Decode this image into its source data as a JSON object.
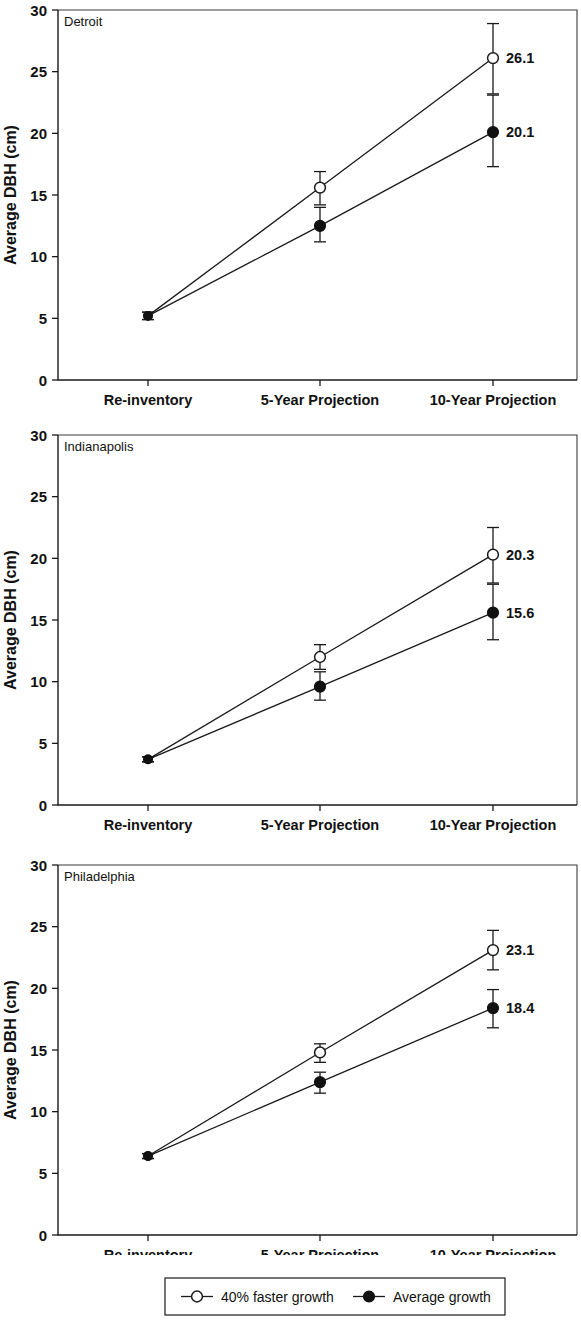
{
  "figure": {
    "y_axis_title": "Average DBH (cm)",
    "y_ticks": [
      "0",
      "5",
      "10",
      "15",
      "20",
      "25",
      "30"
    ],
    "x_categories": [
      "Re-inventory",
      "5-Year Projection",
      "10-Year Projection"
    ]
  },
  "legend": {
    "items": [
      {
        "label": "40% faster growth",
        "marker": "open-circle"
      },
      {
        "label": "Average growth",
        "marker": "filled-circle"
      }
    ]
  },
  "panels": [
    {
      "id": "detroit",
      "label": "Detroit"
    },
    {
      "id": "indianapolis",
      "label": "Indianapolis"
    },
    {
      "id": "philadelphia",
      "label": "Philadelphia"
    }
  ],
  "chart_data": [
    {
      "type": "line",
      "title": "Detroit",
      "xlabel": "",
      "ylabel": "Average DBH (cm)",
      "ylim": [
        0,
        30
      ],
      "yticks": [
        0,
        5,
        10,
        15,
        20,
        25,
        30
      ],
      "grid": false,
      "legend_position": "bottom",
      "categories": [
        "Re-inventory",
        "5-Year Projection",
        "10-Year Projection"
      ],
      "series": [
        {
          "name": "40% faster growth",
          "marker": "open-circle",
          "values": [
            5.2,
            15.6,
            26.1
          ],
          "err_low": [
            0.3,
            1.4,
            2.9
          ],
          "err_high": [
            0.3,
            1.3,
            2.8
          ],
          "point_labels": [
            "",
            "",
            "26.1"
          ]
        },
        {
          "name": "Average growth",
          "marker": "filled-circle",
          "values": [
            5.2,
            12.5,
            20.1
          ],
          "err_low": [
            0.3,
            1.3,
            2.8
          ],
          "err_high": [
            0.3,
            1.5,
            3.0
          ],
          "point_labels": [
            "",
            "",
            "20.1"
          ]
        }
      ]
    },
    {
      "type": "line",
      "title": "Indianapolis",
      "xlabel": "",
      "ylabel": "Average DBH (cm)",
      "ylim": [
        0,
        30
      ],
      "yticks": [
        0,
        5,
        10,
        15,
        20,
        25,
        30
      ],
      "grid": false,
      "legend_position": "bottom",
      "categories": [
        "Re-inventory",
        "5-Year Projection",
        "10-Year Projection"
      ],
      "series": [
        {
          "name": "40% faster growth",
          "marker": "open-circle",
          "values": [
            3.7,
            12.0,
            20.3
          ],
          "err_low": [
            0.2,
            1.0,
            2.3
          ],
          "err_high": [
            0.2,
            1.0,
            2.2
          ],
          "point_labels": [
            "",
            "",
            "20.3"
          ]
        },
        {
          "name": "Average growth",
          "marker": "filled-circle",
          "values": [
            3.7,
            9.6,
            15.6
          ],
          "err_low": [
            0.2,
            1.1,
            2.2
          ],
          "err_high": [
            0.2,
            1.2,
            2.3
          ],
          "point_labels": [
            "",
            "",
            "15.6"
          ]
        }
      ]
    },
    {
      "type": "line",
      "title": "Philadelphia",
      "xlabel": "",
      "ylabel": "Average DBH (cm)",
      "ylim": [
        0,
        30
      ],
      "yticks": [
        0,
        5,
        10,
        15,
        20,
        25,
        30
      ],
      "grid": false,
      "legend_position": "bottom",
      "categories": [
        "Re-inventory",
        "5-Year Projection",
        "10-Year Projection"
      ],
      "series": [
        {
          "name": "40% faster growth",
          "marker": "open-circle",
          "values": [
            6.4,
            14.8,
            23.1
          ],
          "err_low": [
            0.2,
            0.8,
            1.6
          ],
          "err_high": [
            0.2,
            0.7,
            1.6
          ],
          "point_labels": [
            "",
            "",
            "23.1"
          ]
        },
        {
          "name": "Average growth",
          "marker": "filled-circle",
          "values": [
            6.4,
            12.4,
            18.4
          ],
          "err_low": [
            0.2,
            0.9,
            1.6
          ],
          "err_high": [
            0.2,
            0.8,
            1.5
          ],
          "point_labels": [
            "",
            "",
            "18.4"
          ]
        }
      ]
    }
  ]
}
